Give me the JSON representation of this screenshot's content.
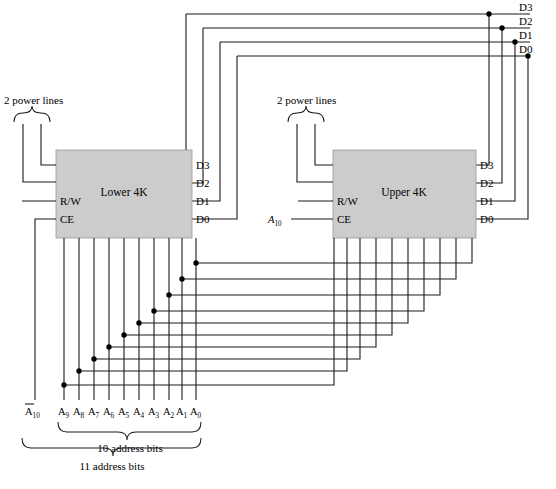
{
  "figure": {
    "type": "logic-diagram"
  },
  "bus": {
    "lines": [
      {
        "name": "D3"
      },
      {
        "name": "D2"
      },
      {
        "name": "D1"
      },
      {
        "name": "D0"
      }
    ]
  },
  "chips": [
    {
      "id": "lower",
      "title": "Lower 4K",
      "control_pins": [
        "R/W",
        "CE"
      ],
      "data_pins": [
        "D3",
        "D2",
        "D1",
        "D0"
      ],
      "power_label": "2 power lines",
      "chip_select_source": ""
    },
    {
      "id": "upper",
      "title": "Upper 4K",
      "control_pins": [
        "R/W",
        "CE"
      ],
      "data_pins": [
        "D3",
        "D2",
        "D1",
        "D0"
      ],
      "power_label": "2 power lines",
      "chip_select_source": "A",
      "chip_select_sub": "10"
    }
  ],
  "address": {
    "inverted_select": {
      "base": "A",
      "sub": "10",
      "overline": true
    },
    "bits": [
      {
        "base": "A",
        "sub": "9"
      },
      {
        "base": "A",
        "sub": "8"
      },
      {
        "base": "A",
        "sub": "7"
      },
      {
        "base": "A",
        "sub": "6"
      },
      {
        "base": "A",
        "sub": "5"
      },
      {
        "base": "A",
        "sub": "4"
      },
      {
        "base": "A",
        "sub": "3"
      },
      {
        "base": "A",
        "sub": "2"
      },
      {
        "base": "A",
        "sub": "1"
      },
      {
        "base": "A",
        "sub": "0"
      }
    ],
    "brace_inner_label": "10 address bits",
    "brace_outer_label": "11 address bits"
  },
  "colors": {
    "chip_fill": "#cccccc",
    "wire": "#1a1a1a",
    "background": "#ffffff"
  }
}
